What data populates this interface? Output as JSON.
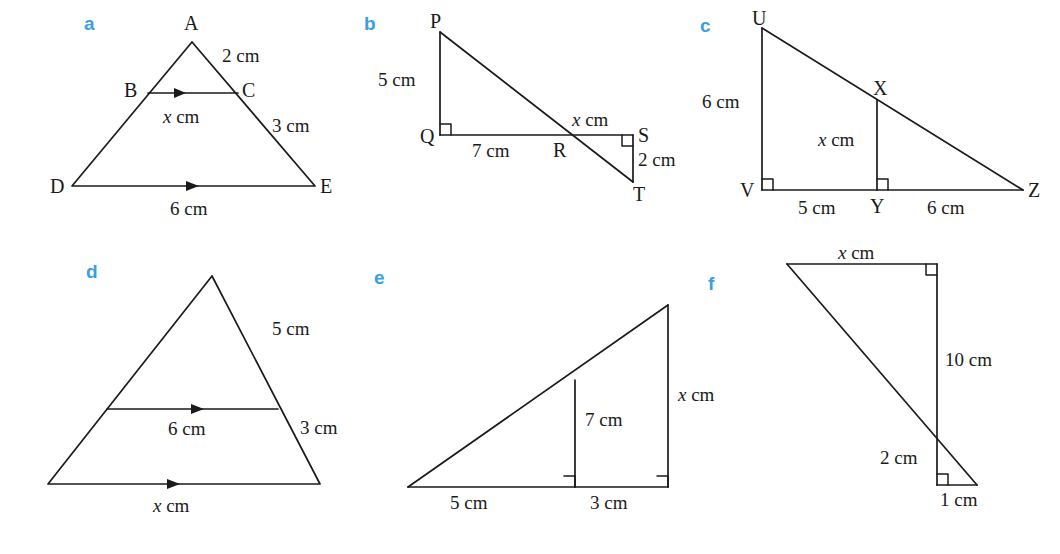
{
  "figure": {
    "accent_color": "#3b9ee0",
    "ink_color": "#1a1a1a",
    "background_color": "#ffffff"
  },
  "panels": [
    {
      "letter": "a",
      "vertices": [
        "A",
        "B",
        "C",
        "D",
        "E"
      ],
      "labels": {
        "A": "A",
        "B": "B",
        "C": "C",
        "D": "D",
        "E": "E",
        "ac": "2 cm",
        "ce": "3 cm",
        "bc": "x cm",
        "de": "6 cm"
      }
    },
    {
      "letter": "b",
      "vertices": [
        "P",
        "Q",
        "R",
        "S",
        "T"
      ],
      "labels": {
        "P": "P",
        "Q": "Q",
        "R": "R",
        "S": "S",
        "T": "T",
        "pq": "5 cm",
        "qr": "7 cm",
        "rs": "x cm",
        "st": "2 cm"
      }
    },
    {
      "letter": "c",
      "vertices": [
        "U",
        "V",
        "X",
        "Y",
        "Z"
      ],
      "labels": {
        "U": "U",
        "V": "V",
        "X": "X",
        "Y": "Y",
        "Z": "Z",
        "uv": "6 cm",
        "xy": "x cm",
        "vy": "5 cm",
        "yz": "6 cm"
      }
    },
    {
      "letter": "d",
      "vertices": [],
      "labels": {
        "upper_right": "5 cm",
        "lower_right": "3 cm",
        "midline": "6 cm",
        "base": "x cm"
      }
    },
    {
      "letter": "e",
      "vertices": [],
      "labels": {
        "inner_height": "7 cm",
        "outer_height": "x cm",
        "left_base": "5 cm",
        "right_base": "3 cm"
      }
    },
    {
      "letter": "f",
      "vertices": [],
      "labels": {
        "top": "x cm",
        "right": "10 cm",
        "small_vertical": "2 cm",
        "small_base": "1 cm"
      }
    }
  ]
}
